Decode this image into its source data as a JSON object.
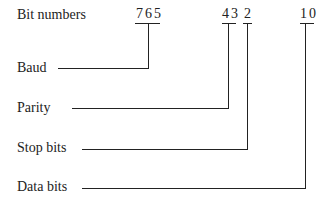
{
  "diagram": {
    "header_label": "Bit numbers",
    "bit_groups": [
      {
        "label": "765",
        "field": "Baud"
      },
      {
        "label": "43",
        "field": "Parity"
      },
      {
        "label": "2",
        "field": "Stop bits"
      },
      {
        "label": "10",
        "field": "Data bits"
      }
    ],
    "fields": [
      "Baud",
      "Parity",
      "Stop bits",
      "Data bits"
    ]
  }
}
